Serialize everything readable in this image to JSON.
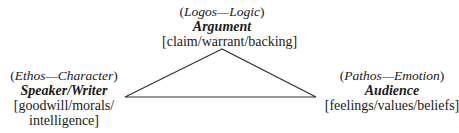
{
  "diagram": {
    "type": "rhetorical-triangle",
    "line_color": "#333333",
    "nodes": {
      "top": {
        "appeal": "Logos",
        "meaning": "Logic",
        "title": "Argument",
        "attributes": "[claim/warrant/backing]"
      },
      "left": {
        "appeal": "Ethos",
        "meaning": "Character",
        "title": "Speaker/Writer",
        "attributes_line1": "[goodwill/morals/",
        "attributes_line2": "intelligence]"
      },
      "right": {
        "appeal": "Pathos",
        "meaning": "Emotion",
        "title": "Audience",
        "attributes": "[feelings/values/beliefs]"
      }
    },
    "separator": "—",
    "open_paren": "(",
    "close_paren": ")"
  }
}
